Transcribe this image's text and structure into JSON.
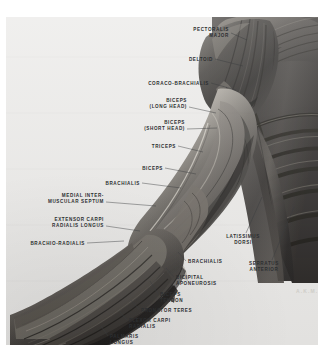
{
  "plate": {
    "title": "Muscles of the Arm — Anterior View",
    "signature": "A.K.M.",
    "background_color": "#ebeae8",
    "label_color": "#2d2f31",
    "page_color": "#ffffff"
  },
  "labels": [
    {
      "id": "pectoralis-major",
      "lines": [
        "PECTORALIS",
        "MAJOR"
      ],
      "align": "right",
      "x": 229,
      "y": 27,
      "leader": [
        [
          231,
          33
        ],
        [
          247,
          40
        ]
      ]
    },
    {
      "id": "deltoid",
      "lines": [
        "DELTOID"
      ],
      "align": "right",
      "x": 213,
      "y": 57,
      "leader": [
        [
          215,
          59
        ],
        [
          243,
          66
        ]
      ]
    },
    {
      "id": "coraco-brachialis",
      "lines": [
        "CORACO-BRACHIALIS"
      ],
      "align": "right",
      "x": 209,
      "y": 81,
      "leader": [
        [
          211,
          83
        ],
        [
          236,
          90
        ]
      ]
    },
    {
      "id": "biceps-long-head",
      "lines": [
        "BICEPS",
        "(LONG HEAD)"
      ],
      "align": "right",
      "x": 187,
      "y": 98,
      "leader": [
        [
          189,
          107
        ],
        [
          216,
          113
        ]
      ]
    },
    {
      "id": "biceps-short-head",
      "lines": [
        "BICEPS",
        "(SHORT HEAD)"
      ],
      "align": "right",
      "x": 185,
      "y": 120,
      "leader": [
        [
          187,
          129
        ],
        [
          217,
          128
        ]
      ]
    },
    {
      "id": "triceps",
      "lines": [
        "TRICEPS"
      ],
      "align": "right",
      "x": 176,
      "y": 144,
      "leader": [
        [
          178,
          146
        ],
        [
          203,
          152
        ]
      ]
    },
    {
      "id": "biceps",
      "lines": [
        "BICEPS"
      ],
      "align": "right",
      "x": 163,
      "y": 166,
      "leader": [
        [
          165,
          168
        ],
        [
          196,
          174
        ]
      ]
    },
    {
      "id": "brachialis-upper",
      "lines": [
        "BRACHIALIS"
      ],
      "align": "right",
      "x": 140,
      "y": 181,
      "leader": [
        [
          142,
          183
        ],
        [
          181,
          188
        ]
      ]
    },
    {
      "id": "medial-intermuscular-septum",
      "lines": [
        "MEDIAL INTER-",
        "MUSCULAR SEPTUM"
      ],
      "align": "right",
      "x": 104,
      "y": 193,
      "leader": [
        [
          106,
          202
        ],
        [
          156,
          206
        ]
      ]
    },
    {
      "id": "extensor-carpi-radialis-longus",
      "lines": [
        "EXTENSOR CARPI",
        "RADIALIS LONGUS"
      ],
      "align": "right",
      "x": 104,
      "y": 217,
      "leader": [
        [
          106,
          226
        ],
        [
          140,
          231
        ]
      ]
    },
    {
      "id": "brachio-radialis",
      "lines": [
        "BRACHIO-RADIALIS"
      ],
      "align": "right",
      "x": 85,
      "y": 241,
      "leader": [
        [
          87,
          243
        ],
        [
          124,
          241
        ]
      ]
    },
    {
      "id": "latissimus-dorsi",
      "lines": [
        "LATISSIMUS",
        "DORSI"
      ],
      "align": "center",
      "x": 243,
      "y": 234,
      "leader": [
        [
          246,
          233
        ],
        [
          262,
          197
        ]
      ]
    },
    {
      "id": "serratus-anterior",
      "lines": [
        "SERRATUS",
        "ANTERIOR"
      ],
      "align": "center",
      "x": 264,
      "y": 261,
      "leader": [
        [
          272,
          260
        ],
        [
          294,
          207
        ]
      ]
    },
    {
      "id": "brachialis-lower",
      "lines": [
        "BRACHIALIS"
      ],
      "align": "left",
      "x": 188,
      "y": 259,
      "leader": [
        [
          186,
          261
        ],
        [
          178,
          252
        ]
      ]
    },
    {
      "id": "bicipital-aponeurosis",
      "lines": [
        "BICIPITAL",
        "APONEUROSIS"
      ],
      "align": "left",
      "x": 176,
      "y": 275,
      "leader": [
        [
          174,
          277
        ],
        [
          166,
          268
        ]
      ]
    },
    {
      "id": "biceps-tendon",
      "lines": [
        "BICEPS",
        "TENDON"
      ],
      "align": "left",
      "x": 160,
      "y": 292,
      "leader": [
        [
          158,
          294
        ],
        [
          150,
          281
        ]
      ]
    },
    {
      "id": "pronator-teres",
      "lines": [
        "PRONATOR  TERES"
      ],
      "align": "left",
      "x": 141,
      "y": 308,
      "leader": [
        [
          139,
          309
        ],
        [
          131,
          300
        ]
      ]
    },
    {
      "id": "flexor-carpi-radialis",
      "lines": [
        "FLEXOR CARPI",
        "RADIALIS"
      ],
      "align": "left",
      "x": 129,
      "y": 318,
      "leader": [
        [
          127,
          320
        ],
        [
          120,
          312
        ]
      ]
    },
    {
      "id": "palmaris-longus",
      "lines": [
        "PALMARIS",
        "LONGUS"
      ],
      "align": "left",
      "x": 110,
      "y": 334,
      "leader": [
        [
          108,
          336
        ],
        [
          101,
          326
        ]
      ]
    }
  ]
}
